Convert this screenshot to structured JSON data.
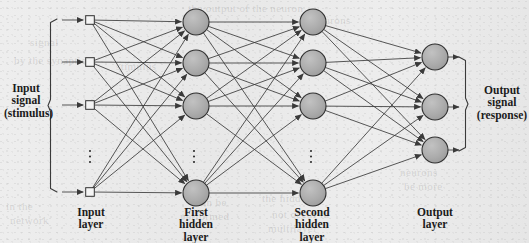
{
  "figure": {
    "type": "neural-network-architecture-diagram",
    "background_color": "#ececec",
    "node_fill_color": "#a9a9a9",
    "node_stroke_color": "#303030",
    "edge_color": "#3a3a3a"
  },
  "labels": {
    "input_signal": [
      "Input",
      "signal",
      "(stimulus)"
    ],
    "output_signal": [
      "Output",
      "signal",
      "(response)"
    ],
    "input_layer": [
      "Input",
      "layer"
    ],
    "first_hidden_layer": [
      "First",
      "hidden",
      "layer"
    ],
    "second_hidden_layer": [
      "Second",
      "hidden",
      "layer"
    ],
    "output_layer": [
      "Output",
      "layer"
    ]
  },
  "layers": [
    {
      "id": "input-layer",
      "name": "Input layer",
      "node_shape": "square",
      "x": 90,
      "visible_nodes": 4,
      "has_ellipsis": true,
      "ellipsis_x": 90,
      "ellipsis_y": 151,
      "nodes_y": [
        20,
        62,
        105,
        192
      ]
    },
    {
      "id": "first-hidden-layer",
      "name": "First hidden layer",
      "node_shape": "circle",
      "x": 196,
      "visible_nodes": 4,
      "has_ellipsis": true,
      "ellipsis_x": 194,
      "ellipsis_y": 151,
      "nodes_y": [
        22,
        63,
        106,
        193
      ]
    },
    {
      "id": "second-hidden-layer",
      "name": "Second hidden layer",
      "node_shape": "circle",
      "x": 313,
      "visible_nodes": 4,
      "has_ellipsis": true,
      "ellipsis_x": 311,
      "ellipsis_y": 151,
      "nodes_y": [
        22,
        63,
        106,
        193
      ]
    },
    {
      "id": "output-layer",
      "name": "Output layer",
      "node_shape": "circle",
      "x": 435,
      "visible_nodes": 3,
      "has_ellipsis": false,
      "nodes_y": [
        57,
        107,
        150
      ]
    }
  ],
  "braces": {
    "left": {
      "x": 48,
      "top": 19,
      "bottom": 192,
      "direction": "left"
    },
    "right": {
      "x": 468,
      "top": 57,
      "bottom": 151,
      "direction": "right"
    }
  },
  "bleed_text": [
    {
      "text": "the output of the neuron",
      "x": 188,
      "y": 2
    },
    {
      "text": "signal",
      "x": 30,
      "y": 36
    },
    {
      "text": "by the synaptic",
      "x": 14,
      "y": 54
    },
    {
      "text": "stimulus",
      "x": 116,
      "y": 60
    },
    {
      "text": "of neurons",
      "x": 300,
      "y": 14
    },
    {
      "text": "the hidden",
      "x": 262,
      "y": 192
    },
    {
      "text": "not occur in",
      "x": 272,
      "y": 208
    },
    {
      "text": "multilayer",
      "x": 268,
      "y": 222
    },
    {
      "text": "can be",
      "x": 196,
      "y": 196
    },
    {
      "text": "performed",
      "x": 180,
      "y": 210
    },
    {
      "text": "in the",
      "x": 6,
      "y": 200
    },
    {
      "text": "network",
      "x": 10,
      "y": 214
    },
    {
      "text": "neurons",
      "x": 400,
      "y": 166
    },
    {
      "text": "be more",
      "x": 404,
      "y": 180
    }
  ]
}
